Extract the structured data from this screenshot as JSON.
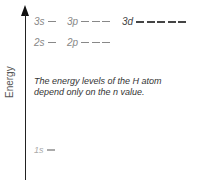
{
  "axis": {
    "label": "Energy"
  },
  "levels": {
    "n3": {
      "s": {
        "label": "3s",
        "orbitals": 1
      },
      "p": {
        "label": "3p",
        "orbitals": 3
      },
      "d": {
        "label": "3d",
        "orbitals": 5
      }
    },
    "n2": {
      "s": {
        "label": "2s",
        "orbitals": 1
      },
      "p": {
        "label": "2p",
        "orbitals": 3
      }
    },
    "n1": {
      "s": {
        "label": "1s",
        "orbitals": 1
      }
    }
  },
  "note": "The energy levels of the H atom depend only on the n value.",
  "colors": {
    "level_text": "#888888",
    "level_3d": "#444444",
    "axis": "#222222"
  }
}
